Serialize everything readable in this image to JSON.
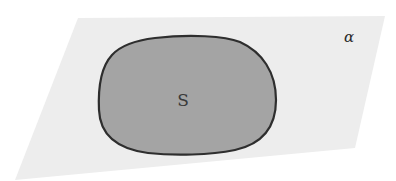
{
  "diagram": {
    "plane": {
      "label": "α",
      "fill": "#ededed",
      "corners": [
        [
          78,
          18
        ],
        [
          385,
          16
        ],
        [
          355,
          148
        ],
        [
          15,
          180
        ]
      ]
    },
    "region": {
      "label": "S",
      "fill": "#a4a4a4",
      "stroke": "#2e2e2e",
      "bounds": {
        "left": 98,
        "top": 36,
        "right": 276,
        "bottom": 155
      }
    },
    "colors": {
      "background": "#ffffff",
      "plane": "#ededed",
      "region_fill": "#a4a4a4",
      "region_outline": "#2e2e2e"
    }
  }
}
